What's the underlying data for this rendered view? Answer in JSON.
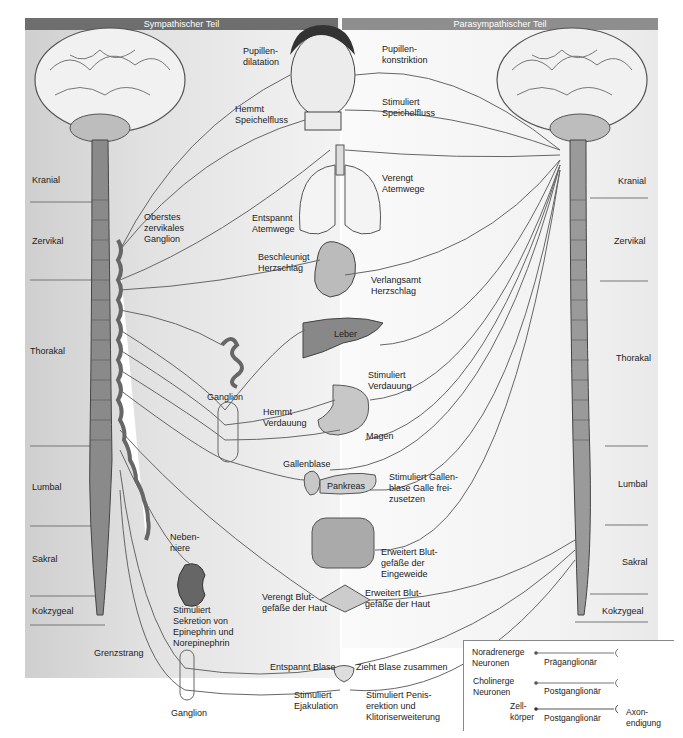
{
  "header": {
    "left_title": "Sympathischer Teil",
    "right_title": "Parasympathischer Teil"
  },
  "regions": {
    "left": [
      "Kranial",
      "Zervikal",
      "Thorakal",
      "Lumbal",
      "Sakral",
      "Kokzygeal"
    ],
    "right": [
      "Kranial",
      "Zervikal",
      "Thorakal",
      "Lumbal",
      "Sakral",
      "Kokzygeal"
    ]
  },
  "organs": {
    "eye": {
      "sympathetic": "Pupillen-\ndilatation",
      "parasympathetic": "Pupillen-\nkonstriktion"
    },
    "salivary": {
      "sympathetic": "Hemmt\nSpeichelfluss",
      "parasympathetic": "Stimuliert\nSpeichelfluss"
    },
    "lungs": {
      "sympathetic": "Entspannt\nAtemwege",
      "parasympathetic": "Verengt\nAtemwege"
    },
    "heart": {
      "sympathetic": "Beschleunigt\nHerzschlag",
      "parasympathetic": "Verlangsamt\nHerzschlag"
    },
    "liver": {
      "label": "Leber"
    },
    "stomach": {
      "label": "Magen",
      "sympathetic": "Hemmt\nVerdauung",
      "parasympathetic": "Stimuliert\nVerdauung"
    },
    "gallbladder": {
      "label": "Gallenblase"
    },
    "pancreas": {
      "label": "Pankreas",
      "parasympathetic": "Stimuliert Gallen-\nblase Galle frei-\nzusetzen"
    },
    "intestine": {
      "parasympathetic": "Erweitert Blut-\ngefäße der\nEingeweide"
    },
    "skin": {
      "sympathetic": "Verengt Blut-\ngefäße der Haut",
      "parasympathetic": "Erweitert Blut-\ngefäße der Haut"
    },
    "adrenal": {
      "label": "Neben-\nniere",
      "sympathetic": "Stimuliert\nSekretion von\nEpinephrin und\nNorepinephrin"
    },
    "bladder": {
      "sympathetic": "Entspannt Blase",
      "parasympathetic": "Zieht Blase zusammen"
    },
    "genitals": {
      "sympathetic": "Stimuliert\nEjakulation",
      "parasympathetic": "Stimuliert Penis-\nerektion und\nKlitoriserweiterung"
    }
  },
  "ganglia": {
    "superior_cervical": "Oberstes\nzervikales\nGanglion",
    "celiac": "Ganglion",
    "pelvic": "Ganglion",
    "chain": "Grenzstrang"
  },
  "legend": {
    "noradrenergic": "Noradrenerge\nNeuronen",
    "cholinergic": "Cholinerge\nNeuronen",
    "preganglionic": "Präganglionär",
    "postganglionic_1": "Postganglionär",
    "postganglionic_2": "Postganglionär",
    "cell_body": "Zell-\nkörper",
    "axon_ending": "Axon-\nendigung"
  }
}
